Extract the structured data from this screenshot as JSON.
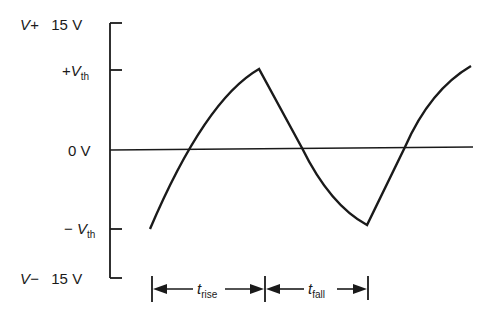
{
  "y_axis": {
    "labels": {
      "top": {
        "prefix": "V+",
        "value": "15 V"
      },
      "vth_pos": {
        "sign": "+",
        "symbol": "V",
        "sub": "th"
      },
      "zero": "0 V",
      "vth_neg": {
        "sign": "−",
        "symbol": "V",
        "sub": "th"
      },
      "bottom": {
        "prefix": "V−",
        "value": "15 V"
      }
    }
  },
  "intervals": {
    "rise": {
      "symbol": "t",
      "sub": "rise"
    },
    "fall": {
      "symbol": "t",
      "sub": "fall"
    }
  },
  "colors": {
    "line": "#1a1a1a",
    "background": "#ffffff"
  }
}
